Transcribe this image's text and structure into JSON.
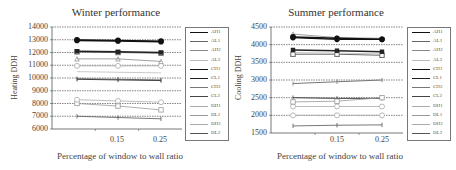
{
  "chart_data": [
    {
      "type": "line",
      "title": "Winter performance",
      "xlabel": "Percentage of window to wall ratio",
      "ylabel": "Heating DDH",
      "categories": [
        "0.05",
        "0.15",
        "0.25"
      ],
      "x_tick_labels": [
        "",
        "0.15",
        "0.25"
      ],
      "ylim": [
        6000,
        14000
      ],
      "y_ticks": [
        "14000",
        "13000",
        "12000",
        "11000",
        "10000",
        "9000",
        "8000",
        "7000",
        "6000"
      ],
      "grid": "horizontal dashed",
      "legend_position": "right",
      "series": [
        {
          "name": "AH1",
          "values": [
            13000,
            12950,
            12900
          ]
        },
        {
          "name": "AL1",
          "values": [
            12050,
            12000,
            11950
          ]
        },
        {
          "name": "AH2",
          "values": [
            11500,
            11500,
            11300
          ]
        },
        {
          "name": "AL2",
          "values": [
            10500,
            10450,
            10400
          ]
        },
        {
          "name": "CH1",
          "values": [
            12950,
            12900,
            12850
          ]
        },
        {
          "name": "CL1",
          "values": [
            12100,
            12050,
            12000
          ]
        },
        {
          "name": "CH2",
          "values": [
            9950,
            9900,
            9850
          ]
        },
        {
          "name": "CL2",
          "values": [
            9900,
            9850,
            9800
          ]
        },
        {
          "name": "DH1",
          "values": [
            10950,
            10950,
            10950
          ]
        },
        {
          "name": "DL1",
          "values": [
            8000,
            7800,
            7500
          ]
        },
        {
          "name": "DH2",
          "values": [
            8300,
            8200,
            8100
          ]
        },
        {
          "name": "DL2",
          "values": [
            7000,
            6900,
            6800
          ]
        }
      ]
    },
    {
      "type": "line",
      "title": "Summer performance",
      "xlabel": "Percentage of window to wall ratio",
      "ylabel": "Cooling DDH",
      "categories": [
        "0.05",
        "0.15",
        "0.25"
      ],
      "x_tick_labels": [
        "",
        "0.15",
        "0.25"
      ],
      "ylim": [
        1500,
        4500
      ],
      "y_ticks": [
        "4500",
        "4000",
        "3500",
        "3000",
        "2500",
        "2000",
        "1500"
      ],
      "grid": "horizontal dashed",
      "legend_position": "right",
      "series": [
        {
          "name": "AH1",
          "values": [
            4200,
            4150,
            4150
          ]
        },
        {
          "name": "AL1",
          "values": [
            3730,
            3730,
            3700
          ]
        },
        {
          "name": "AH2",
          "values": [
            4300,
            4200,
            4180
          ]
        },
        {
          "name": "AL2",
          "values": [
            3780,
            3760,
            3740
          ]
        },
        {
          "name": "CH1",
          "values": [
            4220,
            4180,
            4150
          ]
        },
        {
          "name": "CL1",
          "values": [
            3850,
            3830,
            3800
          ]
        },
        {
          "name": "CH2",
          "values": [
            2900,
            2950,
            3000
          ]
        },
        {
          "name": "CL2",
          "values": [
            2500,
            2480,
            2480
          ]
        },
        {
          "name": "DH1",
          "values": [
            2250,
            2250,
            2250
          ]
        },
        {
          "name": "DL1",
          "values": [
            2380,
            2400,
            2500
          ]
        },
        {
          "name": "DH2",
          "values": [
            2000,
            2000,
            2000
          ]
        },
        {
          "name": "DL2",
          "values": [
            1700,
            1720,
            1730
          ]
        }
      ]
    }
  ],
  "winter": {
    "title": "Winter performance",
    "xlabel": "Percentage of window to wall ratio",
    "ylabel": "Heating DDH",
    "yticks": [
      "14000",
      "13000",
      "12000",
      "11000",
      "10000",
      "9000",
      "8000",
      "7000",
      "6000"
    ],
    "xticks": [
      "0.15",
      "0.25"
    ],
    "legend": [
      "AH1",
      "AL1",
      "AH2",
      "AL2",
      "CH1",
      "CL1",
      "CH2",
      "CL2",
      "DH1",
      "DL1",
      "DH2",
      "DL2"
    ]
  },
  "summer": {
    "title": "Summer performance",
    "xlabel": "Percentage of window to wall ratio",
    "ylabel": "Cooling DDH",
    "yticks": [
      "4500",
      "4000",
      "3500",
      "3000",
      "2500",
      "2000",
      "1500"
    ],
    "xticks": [
      "0.15",
      "0.25"
    ],
    "legend": [
      "AH1",
      "AL1",
      "AH2",
      "AL2",
      "CH1",
      "CL1",
      "CH2",
      "CL2",
      "DH1",
      "DL1",
      "DH2",
      "DL2"
    ]
  },
  "styles": {
    "AH1": {
      "color": "#111111",
      "marker": "circle-filled",
      "width": 1.2
    },
    "AL1": {
      "color": "#666666",
      "marker": "square",
      "width": 1
    },
    "AH2": {
      "color": "#888888",
      "marker": "tri",
      "width": 0.8
    },
    "AL2": {
      "color": "#bbbbbb",
      "marker": "none",
      "width": 0.8
    },
    "CH1": {
      "color": "#111111",
      "marker": "circle-filled",
      "width": 1.5
    },
    "CL1": {
      "color": "#222222",
      "marker": "square-filled",
      "width": 1.5
    },
    "CH2": {
      "color": "#777777",
      "marker": "plus",
      "width": 1
    },
    "CL2": {
      "color": "#444444",
      "marker": "plus",
      "width": 1
    },
    "DH1": {
      "color": "#aaaaaa",
      "marker": "circle-open",
      "width": 0.8
    },
    "DL1": {
      "color": "#999999",
      "marker": "square-open",
      "width": 0.8
    },
    "DH2": {
      "color": "#aaaaaa",
      "marker": "circle-open",
      "width": 0.8
    },
    "DL2": {
      "color": "#555555",
      "marker": "plus",
      "width": 0.8
    }
  }
}
